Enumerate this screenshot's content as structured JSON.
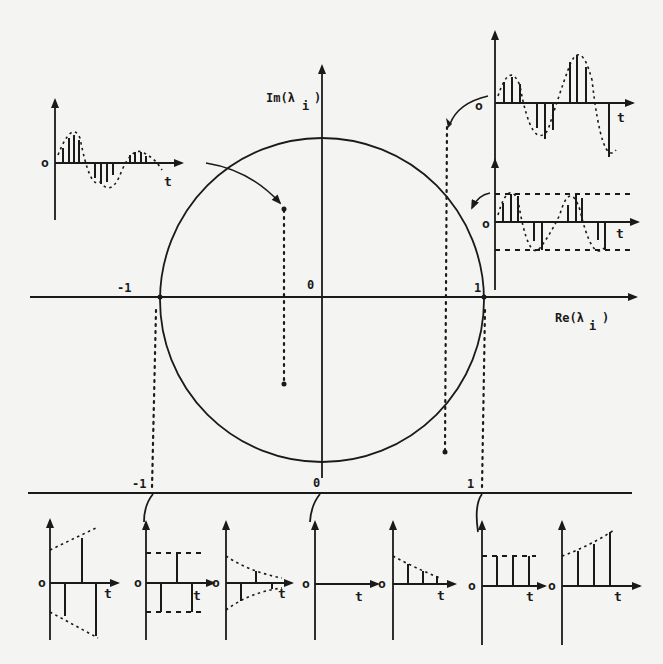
{
  "figure": {
    "main_axes": {
      "x_label": "Re(λ",
      "x_label_sub": "i",
      "x_label_close": ")",
      "y_label": "Im(λ",
      "y_label_sub": "i",
      "y_label_close": ")",
      "tick_neg1": "-1",
      "tick_0": "0",
      "tick_1": "1"
    },
    "unit_circle": {
      "center": [
        0,
        0
      ],
      "radius": 1
    },
    "bottom_axis": {
      "tick_neg1": "-1",
      "tick_0": "0",
      "tick_1": "1"
    },
    "plots": {
      "origin_label": "o",
      "time_label": "t"
    },
    "pole_examples": [
      {
        "location": "inside unit circle, left half-plane (complex)",
        "response": "decaying oscillation"
      },
      {
        "location": "outside unit circle, right half-plane (complex)",
        "response": "growing oscillation"
      },
      {
        "location": "on unit circle (complex)",
        "response": "sustained oscillation"
      },
      {
        "location": "real axis < -1",
        "response": "growing alternating"
      },
      {
        "location": "real axis = -1",
        "response": "constant alternating"
      },
      {
        "location": "real axis between -1 and 0",
        "response": "decaying alternating"
      },
      {
        "location": "real axis = 0",
        "response": "zero"
      },
      {
        "location": "real axis between 0 and 1",
        "response": "decaying monotone"
      },
      {
        "location": "real axis = 1",
        "response": "constant"
      },
      {
        "location": "real axis > 1",
        "response": "growing monotone"
      }
    ]
  }
}
